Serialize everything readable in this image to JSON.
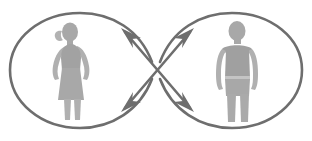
{
  "diagram": {
    "canvas": {
      "width": 312,
      "height": 141,
      "background": "#ffffff"
    },
    "colors": {
      "stroke": "#6e6e6e",
      "figure_fill": "#a8a8a8",
      "figure_fill_light": "#c4c4c4",
      "background": "#ffffff"
    },
    "stroke_width": 2.6,
    "loops": [
      {
        "id": "left-loop",
        "label": "left loop",
        "center_x": 82,
        "center_y": 70,
        "radius_x": 74,
        "radius_y": 57,
        "contains": "female-figure"
      },
      {
        "id": "right-loop",
        "label": "right loop",
        "center_x": 230,
        "center_y": 70,
        "radius_x": 74,
        "radius_y": 57,
        "contains": "male-figure"
      }
    ],
    "crossing_point": {
      "x": 156,
      "y": 70
    },
    "arrows": [
      {
        "id": "arrow-top-left",
        "label": "upper-left arrowhead",
        "direction": "up-left",
        "x": 128,
        "y": 34,
        "angle": 217
      },
      {
        "id": "arrow-top-right",
        "label": "upper-right arrowhead",
        "direction": "up-right",
        "x": 184,
        "y": 34,
        "angle": 323
      },
      {
        "id": "arrow-bottom-left",
        "label": "lower-left arrowhead",
        "direction": "down-left",
        "x": 128,
        "y": 106,
        "angle": 143
      },
      {
        "id": "arrow-bottom-right",
        "label": "lower-right arrowhead",
        "direction": "down-right",
        "x": 184,
        "y": 106,
        "angle": 37
      }
    ],
    "figures": [
      {
        "id": "female-figure",
        "label": "female silhouette",
        "gender": "female",
        "features": [
          "head",
          "ponytail",
          "arms",
          "dress",
          "legs"
        ],
        "center_x": 72,
        "center_y": 70,
        "height": 92
      },
      {
        "id": "male-figure",
        "label": "male silhouette",
        "gender": "male",
        "features": [
          "head",
          "torso",
          "arms",
          "trousers",
          "legs"
        ],
        "center_x": 238,
        "center_y": 68,
        "height": 94
      }
    ]
  }
}
